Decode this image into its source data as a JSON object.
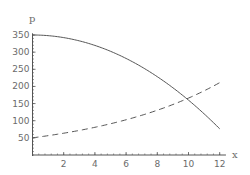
{
  "chart_data": {
    "type": "line",
    "title": "",
    "xlabel": "x",
    "ylabel": "p",
    "xlim": [
      0,
      12.5
    ],
    "ylim": [
      0,
      370
    ],
    "grid": false,
    "x_ticks": [
      2,
      4,
      6,
      8,
      10,
      12
    ],
    "y_ticks": [
      50,
      100,
      150,
      200,
      250,
      300,
      350
    ],
    "series": [
      {
        "name": "demand (solid)",
        "style": "solid",
        "x": [
          0,
          1,
          2,
          3,
          4,
          5,
          6,
          7,
          8,
          9,
          10,
          11,
          12
        ],
        "values": [
          350,
          348,
          342,
          333,
          320,
          302,
          282,
          257,
          228,
          196,
          160,
          120,
          76
        ]
      },
      {
        "name": "supply (dashed)",
        "style": "dashed",
        "x": [
          0,
          1,
          2,
          3,
          4,
          5,
          6,
          7,
          8,
          9,
          10,
          11,
          12
        ],
        "values": [
          50,
          56,
          64,
          72,
          81,
          91,
          103,
          116,
          131,
          147,
          166,
          187,
          211
        ]
      }
    ],
    "annotations": [],
    "legend": null
  },
  "axes": {
    "x_label": "x",
    "y_label": "p",
    "x_tick_labels": [
      "2",
      "4",
      "6",
      "8",
      "10",
      "12"
    ],
    "y_tick_labels": [
      "50",
      "100",
      "150",
      "200",
      "250",
      "300",
      "350"
    ]
  },
  "colors": {
    "axis": "#555555",
    "curve": "#555555",
    "text": "#6b6b6b"
  }
}
